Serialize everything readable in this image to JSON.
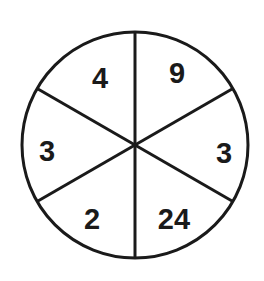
{
  "diagram": {
    "type": "number-wheel-puzzle",
    "circle": {
      "cx": 135,
      "cy": 145,
      "r": 113,
      "stroke": "#1a1a1a",
      "stroke_width": 3
    },
    "spokes_deg": [
      90,
      30,
      -30,
      -90,
      -150,
      150
    ],
    "sectors": [
      {
        "position": "top-left",
        "value": "4",
        "x": 100,
        "y": 88
      },
      {
        "position": "top-right",
        "value": "9",
        "x": 177,
        "y": 83
      },
      {
        "position": "right",
        "value": "3",
        "x": 224,
        "y": 163
      },
      {
        "position": "bottom-right",
        "value": "24",
        "x": 174,
        "y": 229
      },
      {
        "position": "bottom-left",
        "value": "2",
        "x": 92,
        "y": 229
      },
      {
        "position": "left",
        "value": "3",
        "x": 47,
        "y": 161
      }
    ]
  }
}
